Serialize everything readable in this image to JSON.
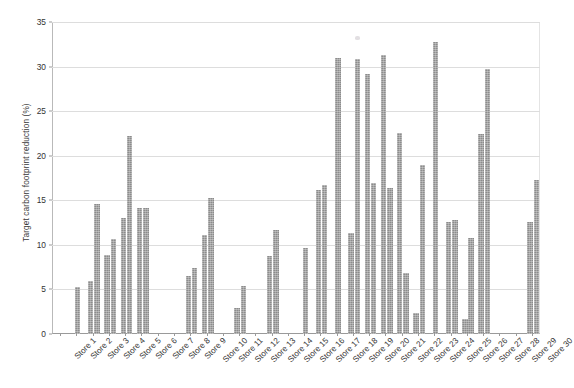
{
  "chart_data": {
    "type": "bar",
    "title": "",
    "xlabel": "",
    "ylabel": "Target carbon footprint reduction (%)",
    "ylim": [
      0,
      35
    ],
    "yticks": [
      0,
      5,
      10,
      15,
      20,
      25,
      30,
      35
    ],
    "grid": true,
    "legend": false,
    "legend_position": "none",
    "bar_color": "#8c8c8c",
    "categories": [
      "Store 1",
      "Store 2",
      "Store 3",
      "Store 4",
      "Store 5",
      "Store 6",
      "Store 7",
      "Store 8",
      "Store 9",
      "Store 10",
      "Store 11",
      "Store 12",
      "Store 13",
      "Store 14",
      "Store 15",
      "Store 16",
      "Store 17",
      "Store 18",
      "Store 19",
      "Store 20",
      "Store 21",
      "Store 22",
      "Store 23",
      "Store 24",
      "Store 25",
      "Store 26",
      "Store 27",
      "Store 28",
      "Store 29",
      "Store 30"
    ],
    "series": [
      {
        "name": "Series A",
        "values": [
          null,
          5.3,
          5.9,
          8.9,
          13.0,
          14.1,
          null,
          null,
          6.5,
          11.1,
          null,
          2.9,
          null,
          8.7,
          null,
          9.6,
          16.1,
          31.0,
          11.3,
          16.9,
          16.4,
          2.4,
          19.0,
          12.6,
          1.7,
          10.8,
          29.7,
          null,
          null,
          12.6
        ]
      },
      {
        "name": "Series B",
        "values": [
          null,
          null,
          14.6,
          10.7,
          22.2,
          14.1,
          null,
          null,
          7.4,
          15.3,
          null,
          5.4,
          null,
          11.7,
          null,
          16.7,
          30.9,
          29.2,
          31.3,
          22.6,
          6.9,
          null,
          32.8,
          12.8,
          22.4,
          null,
          null,
          null,
          null,
          17.3
        ]
      }
    ],
    "bars": [
      {
        "store": "Store 2",
        "index": 1,
        "values": [
          5.3
        ]
      },
      {
        "store": "Store 3",
        "index": 2,
        "values": [
          5.9,
          14.6
        ]
      },
      {
        "store": "Store 4",
        "index": 3,
        "values": [
          8.9,
          10.7
        ]
      },
      {
        "store": "Store 5",
        "index": 4,
        "values": [
          13.0,
          22.2
        ]
      },
      {
        "store": "Store 6",
        "index": 5,
        "values": [
          14.1,
          14.1
        ]
      },
      {
        "store": "Store 9",
        "index": 8,
        "values": [
          6.5,
          7.4
        ]
      },
      {
        "store": "Store 10",
        "index": 9,
        "values": [
          11.1,
          15.3
        ]
      },
      {
        "store": "Store 12",
        "index": 11,
        "values": [
          2.9,
          5.4
        ]
      },
      {
        "store": "Store 14",
        "index": 13,
        "values": [
          8.7,
          11.7
        ]
      },
      {
        "store": "Store 16",
        "index": 15,
        "values": [
          9.6
        ]
      },
      {
        "store": "Store 17",
        "index": 16,
        "values": [
          16.1,
          16.7
        ]
      },
      {
        "store": "Store 18",
        "index": 17,
        "values": [
          31.0
        ]
      },
      {
        "store": "Store 19",
        "index": 18,
        "values": [
          11.3,
          30.9
        ]
      },
      {
        "store": "Store 20",
        "index": 19,
        "values": [
          29.2,
          16.9
        ]
      },
      {
        "store": "Store 21",
        "index": 20,
        "values": [
          31.3,
          16.4
        ]
      },
      {
        "store": "Store 22",
        "index": 21,
        "values": [
          22.6,
          6.9
        ]
      },
      {
        "store": "Store 23",
        "index": 22,
        "values": [
          2.4,
          19.0
        ]
      },
      {
        "store": "Store 24",
        "index": 23,
        "values": [
          32.8
        ]
      },
      {
        "store": "Store 25",
        "index": 24,
        "values": [
          12.6,
          12.8
        ]
      },
      {
        "store": "Store 26",
        "index": 25,
        "values": [
          1.7,
          10.8
        ]
      },
      {
        "store": "Store 27",
        "index": 26,
        "values": [
          22.4,
          29.7
        ]
      },
      {
        "store": "Store 30",
        "index": 29,
        "values": [
          12.6,
          17.3
        ]
      }
    ]
  }
}
